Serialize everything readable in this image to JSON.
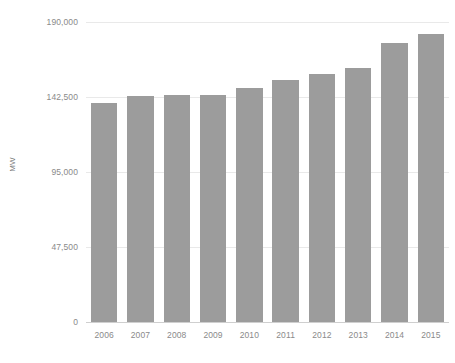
{
  "chart_data": {
    "type": "bar",
    "title": "",
    "subtitle": "",
    "xlabel": "",
    "ylabel": "MW",
    "categories": [
      "2006",
      "2007",
      "2008",
      "2009",
      "2010",
      "2011",
      "2012",
      "2013",
      "2014",
      "2015"
    ],
    "values": [
      138700,
      143100,
      143800,
      143800,
      148200,
      153300,
      157100,
      160900,
      176700,
      182400
    ],
    "series": [
      {
        "name": "MW",
        "values": [
          138700,
          143100,
          143800,
          143800,
          148200,
          153300,
          157100,
          160900,
          176700,
          182400
        ]
      }
    ],
    "ylim": [
      0,
      190000
    ],
    "y_ticks": [
      0,
      47500,
      95000,
      142500,
      190000
    ],
    "y_tick_labels": [
      "0",
      "47,500",
      "95,000",
      "142,500",
      "190,000"
    ],
    "grid": true,
    "legend": false,
    "legend_position": "none",
    "bar_color": "#9c9c9c",
    "background_color": "#ffffff",
    "gridline_color": "#e9e9e9",
    "axis_label_color": "#8a8a8a"
  },
  "axes": {
    "y_title": "MW"
  }
}
